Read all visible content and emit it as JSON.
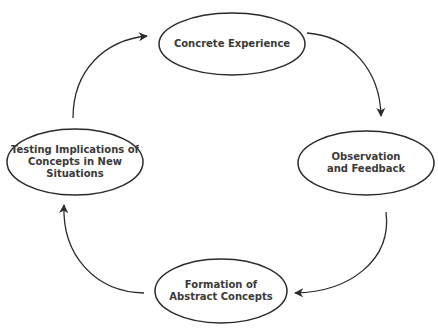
{
  "diagram": {
    "type": "cycle",
    "stroke_color": "#2b2b2b",
    "text_color": "#3a3a3a",
    "background": "#ffffff",
    "nodes": [
      {
        "id": "concrete-experience",
        "label": "Concrete Experience"
      },
      {
        "id": "observation-feedback",
        "label": "Observation\nand Feedback"
      },
      {
        "id": "formation-abstract-concepts",
        "label": "Formation of\nAbstract Concepts"
      },
      {
        "id": "testing-implications",
        "label": "Testing Implications of\nConcepts in New\nSituations"
      }
    ],
    "edges": [
      {
        "from": "concrete-experience",
        "to": "observation-feedback"
      },
      {
        "from": "observation-feedback",
        "to": "formation-abstract-concepts"
      },
      {
        "from": "formation-abstract-concepts",
        "to": "testing-implications"
      },
      {
        "from": "testing-implications",
        "to": "concrete-experience"
      }
    ]
  }
}
